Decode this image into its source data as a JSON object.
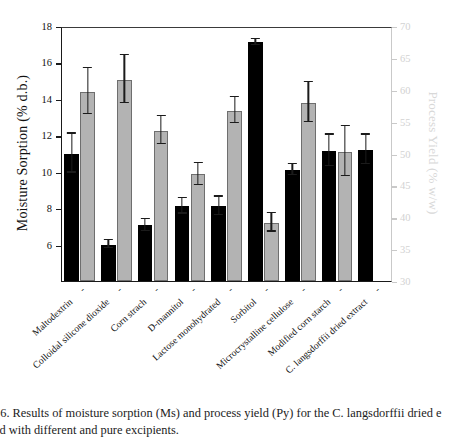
{
  "chart_data": {
    "type": "bar",
    "title": "",
    "xlabel": "",
    "ylabel": "Moisture Sorption (% d.b.)",
    "y2label": "Process Yield (% w/w)",
    "ylim": [
      4,
      18
    ],
    "y2lim": [
      30,
      70
    ],
    "yticks": [
      6,
      8,
      10,
      12,
      14,
      16,
      18
    ],
    "y2ticks": [
      30,
      35,
      40,
      45,
      50,
      55,
      60,
      65,
      70
    ],
    "grid": false,
    "legend": "none",
    "categories": [
      "Maltodextrin",
      "Colloidal silicone dioxide",
      "Corn strach",
      "D-mannitol",
      "Lactose monohydrated",
      "Sorbitol",
      "Microcrystalline cellulose",
      "Modified corn starch",
      "C. langsdorffii dried extract"
    ],
    "series": [
      {
        "name": "Moisture Sorption (Ms)",
        "axis": "left",
        "color": "#000000",
        "values": [
          11.0,
          6.0,
          7.05,
          8.1,
          8.1,
          17.1,
          10.1,
          11.15,
          11.2
        ],
        "errors": [
          1.1,
          0.25,
          0.35,
          0.45,
          0.55,
          0.2,
          0.35,
          0.9,
          0.85
        ]
      },
      {
        "name": "Process Yield (Py)",
        "axis": "left_scaled",
        "color": "#b3b3b3",
        "values": [
          14.4,
          15.05,
          12.25,
          9.85,
          13.35,
          7.2,
          13.8,
          11.1,
          null
        ],
        "errors": [
          1.3,
          1.35,
          0.8,
          0.65,
          0.75,
          0.55,
          1.15,
          1.4,
          null
        ]
      }
    ],
    "py_values_right_axis": [
      59.7,
      61.6,
      53.6,
      46.7,
      56.7,
      39.1,
      58.0,
      50.3,
      null
    ],
    "caption": "16. Results of moisture sorption (Ms) and process yield (Py) for the C. langsdorffii dried e\ned with different and pure excipients.",
    "tick_dash": "-"
  }
}
